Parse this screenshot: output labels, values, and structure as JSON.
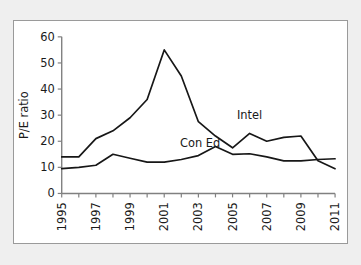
{
  "chart_data": {
    "type": "line",
    "title": "",
    "xlabel": "",
    "ylabel": "P/E ratio",
    "xlim": [
      1995,
      2011
    ],
    "ylim": [
      0,
      60
    ],
    "grid": false,
    "legend_position": "inline-annotation",
    "x": [
      1995,
      1996,
      1997,
      1998,
      1999,
      2000,
      2001,
      2002,
      2003,
      2004,
      2005,
      2006,
      2007,
      2008,
      2009,
      2010,
      2011
    ],
    "x_tick_labels": [
      "1995",
      "",
      "1997",
      "",
      "1999",
      "",
      "2001",
      "",
      "2003",
      "",
      "2005",
      "",
      "2007",
      "",
      "2009",
      "",
      "2011"
    ],
    "y_ticks": [
      0,
      10,
      20,
      30,
      40,
      50,
      60
    ],
    "y_tick_labels": [
      "0",
      "10",
      "20",
      "30",
      "40",
      "50",
      "60"
    ],
    "series": [
      {
        "name": "Intel",
        "color": "#171717",
        "annotation": "Intel",
        "annotation_x": 2006,
        "annotation_y": 28.5,
        "values": [
          14,
          14,
          21,
          24,
          29,
          36,
          55,
          45,
          27.5,
          22,
          17.5,
          23,
          20,
          21.5,
          22,
          12.5,
          9.5
        ]
      },
      {
        "name": "Con Ed",
        "color": "#171717",
        "annotation": "Con Ed",
        "annotation_x": 2003.1,
        "annotation_y": 17.6,
        "values": [
          9.5,
          10,
          10.8,
          15,
          13.5,
          12,
          12,
          13,
          14.5,
          18,
          15,
          15.2,
          14,
          12.5,
          12.5,
          13,
          13.3
        ]
      }
    ]
  },
  "figure": {
    "frame_border_color": "#9a9a9a",
    "page_background": "#efefef",
    "plot_background": "#ffffff"
  }
}
